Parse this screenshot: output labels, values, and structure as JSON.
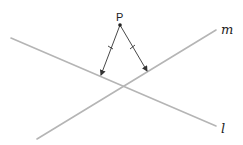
{
  "diagram": {
    "type": "geometry",
    "point_label": "P",
    "lines": [
      {
        "id": "m",
        "label": "m"
      },
      {
        "id": "l",
        "label": "l"
      }
    ],
    "segments": [
      {
        "from": "P",
        "to": "line-l",
        "tick_marks": 1,
        "arrow": true
      },
      {
        "from": "P",
        "to": "line-m",
        "tick_marks": 1,
        "arrow": true
      }
    ],
    "colors": {
      "lines": "#b5b5b5",
      "segments": "#333333",
      "labels": "#222222"
    }
  }
}
